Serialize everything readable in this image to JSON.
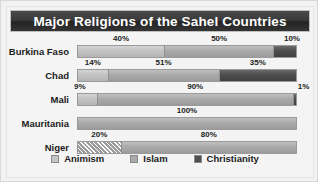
{
  "chart_data": {
    "type": "bar",
    "subtype": "stacked-horizontal-100pct",
    "title": "Major Religions of the Sahel Countries",
    "xlabel": "",
    "ylabel": "",
    "xlim": [
      0,
      100
    ],
    "grid": false,
    "legend_position": "bottom",
    "categories": [
      "Burkina Faso",
      "Chad",
      "Mali",
      "Mauritania",
      "Niger"
    ],
    "series": [
      {
        "name": "Animism",
        "values": [
          40,
          14,
          9,
          0,
          20
        ]
      },
      {
        "name": "Islam",
        "values": [
          50,
          51,
          90,
          100,
          80
        ]
      },
      {
        "name": "Christianity",
        "values": [
          10,
          35,
          1,
          0,
          0
        ]
      }
    ],
    "value_labels": {
      "Burkina Faso": [
        "40%",
        "50%",
        "10%"
      ],
      "Chad": [
        "14%",
        "51%",
        "35%"
      ],
      "Mali": [
        "9%",
        "90%",
        "1%"
      ],
      "Mauritania": [
        "100%"
      ],
      "Niger": [
        "20%",
        "80%"
      ]
    }
  },
  "header": {
    "title": "Major Religions of the Sahel Countries"
  },
  "rows": [
    {
      "label": "Burkina Faso",
      "segments": [
        {
          "religion": "Animism",
          "pct": 40,
          "label": "40%",
          "style": "solid"
        },
        {
          "religion": "Islam",
          "pct": 50,
          "label": "50%",
          "style": "solid"
        },
        {
          "religion": "Christianity",
          "pct": 10,
          "label": "10%",
          "style": "solid"
        }
      ]
    },
    {
      "label": "Chad",
      "segments": [
        {
          "religion": "Animism",
          "pct": 14,
          "label": "14%",
          "style": "solid"
        },
        {
          "religion": "Islam",
          "pct": 51,
          "label": "51%",
          "style": "solid"
        },
        {
          "religion": "Christianity",
          "pct": 35,
          "label": "35%",
          "style": "solid"
        }
      ]
    },
    {
      "label": "Mali",
      "segments": [
        {
          "religion": "Animism",
          "pct": 9,
          "label": "9%",
          "style": "solid"
        },
        {
          "religion": "Islam",
          "pct": 90,
          "label": "90%",
          "style": "solid"
        },
        {
          "religion": "Christianity",
          "pct": 1,
          "label": "1%",
          "style": "solid"
        }
      ]
    },
    {
      "label": "Mauritania",
      "segments": [
        {
          "religion": "Islam",
          "pct": 100,
          "label": "100%",
          "style": "solid"
        }
      ]
    },
    {
      "label": "Niger",
      "segments": [
        {
          "religion": "Animism",
          "pct": 20,
          "label": "20%",
          "style": "hatch"
        },
        {
          "religion": "Islam",
          "pct": 80,
          "label": "80%",
          "style": "solid"
        }
      ]
    }
  ],
  "legend": {
    "items": [
      {
        "label": "Animism",
        "color": "#c4c4c4"
      },
      {
        "label": "Islam",
        "color": "#ababab"
      },
      {
        "label": "Christianity",
        "color": "#4f4f4f"
      }
    ]
  },
  "colors": {
    "animism": "#c4c4c4",
    "islam": "#ababab",
    "christianity": "#4f4f4f",
    "title_bar": "#343434",
    "title_text": "#ffffff",
    "plate": "#f4f4f4",
    "frame": "#d8d8d8",
    "text": "#1c1c1c"
  }
}
